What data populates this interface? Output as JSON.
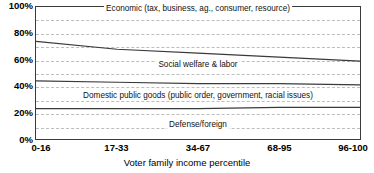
{
  "chart_data": {
    "type": "area",
    "title": "",
    "subtitle": "",
    "xlabel": "Voter family income percentile",
    "ylabel": "",
    "xlim": [
      0,
      4
    ],
    "ylim": [
      0,
      100
    ],
    "grid": true,
    "grid_interval": 10,
    "legend_position": "inline-labels",
    "stacked": true,
    "unit": "%",
    "categories": [
      "0-16",
      "17-33",
      "34-67",
      "68-95",
      "96-100"
    ],
    "y_tick_labels": [
      "100%",
      "80%",
      "60%",
      "40%",
      "20%",
      "0%"
    ],
    "y_tick_values": [
      100,
      80,
      60,
      40,
      20,
      0
    ],
    "gridline_values": [
      90,
      80,
      70,
      60,
      50,
      40,
      30,
      20,
      10
    ],
    "boundary_series": [
      {
        "name": "top-of-social-welfare-and-labor",
        "values": [
          74,
          68,
          65,
          62,
          59
        ]
      },
      {
        "name": "top-of-domestic-public-goods",
        "values": [
          44,
          43,
          42,
          42,
          41
        ]
      },
      {
        "name": "top-of-defense-foreign",
        "values": [
          23,
          23,
          23,
          24,
          24
        ]
      }
    ],
    "series": [
      {
        "name": "Defense/foreign",
        "label": "Defense/foreign",
        "values": [
          23,
          23,
          23,
          24,
          24
        ],
        "label_x_index": 2,
        "label_y": 11
      },
      {
        "name": "Domestic public goods (public order, government, racial issues)",
        "label": "Domestic public goods (public order, government, racial issues)",
        "values": [
          21,
          20,
          19,
          18,
          17
        ],
        "label_x_index": 2,
        "label_y": 33
      },
      {
        "name": "Social welfare & labor",
        "label": "Social welfare & labor",
        "values": [
          30,
          25,
          23,
          20,
          18
        ],
        "label_x_index": 2,
        "label_y": 56
      },
      {
        "name": "Economic (tax, business, ag., consumer, resource)",
        "label": "Economic (tax, business, ag., consumer, resource)",
        "values": [
          26,
          32,
          35,
          38,
          41
        ],
        "label_x_index": 2,
        "label_y": 98
      }
    ],
    "annotations": [
      {
        "text": "Economic (tax, business, ag., consumer, resource)",
        "x_index": 2,
        "y": 98
      },
      {
        "text": "Social welfare & labor",
        "x_index": 2,
        "y": 56
      },
      {
        "text": "Domestic public goods (public order, government, racial issues)",
        "x_index": 2,
        "y": 33
      },
      {
        "text": "Defense/foreign",
        "x_index": 2,
        "y": 11
      }
    ],
    "colors": {
      "line": "#3a3a3a",
      "grid": "#bdbdbd",
      "frame": "#3a3a3a",
      "background": "#ffffff",
      "text": "#000000"
    }
  }
}
